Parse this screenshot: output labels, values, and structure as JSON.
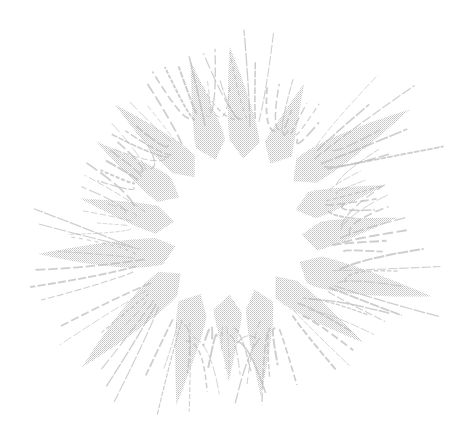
{
  "illustration": {
    "subject": "engraved-sunburst",
    "center": [
      236,
      228
    ],
    "ray_count": 16,
    "inner_radius": 62,
    "outer_radius_min": 150,
    "outer_radius_max": 215,
    "colors": {
      "background": "#ffffff",
      "ray_fill": "#c9c9c9",
      "ray_streak": "#bdbdbd"
    }
  }
}
